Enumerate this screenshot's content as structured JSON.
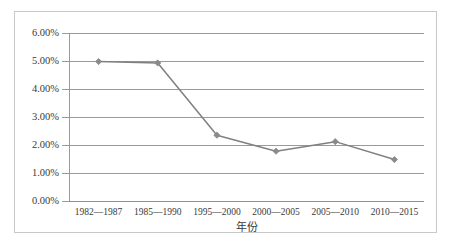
{
  "chart_data": {
    "type": "line",
    "title": "",
    "xlabel": "年份",
    "ylabel": "",
    "categories": [
      "1982—1987",
      "1985—1990",
      "1995—2000",
      "2000—2005",
      "2005—2010",
      "2010—2015"
    ],
    "values": [
      4.98,
      4.93,
      2.35,
      1.78,
      2.12,
      1.48
    ],
    "ylim": [
      0,
      6
    ],
    "ytick_step": 1,
    "ytick_labels": [
      "0.00%",
      "1.00%",
      "2.00%",
      "3.00%",
      "4.00%",
      "5.00%",
      "6.00%"
    ],
    "ytick_values": [
      0,
      1,
      2,
      3,
      4,
      5,
      6
    ],
    "value_suffix": "%",
    "grid": true,
    "legend": false,
    "legend_position": "none",
    "marker": "diamond",
    "series": [
      {
        "name": "",
        "values": [
          4.98,
          4.93,
          2.35,
          1.78,
          2.12,
          1.48
        ]
      }
    ]
  },
  "colors": {
    "series_line": "#808080",
    "marker": "#8a8a8a",
    "gridline": "#9a9a9a",
    "axis": "#9a9a9a",
    "frame": "#c9c9c9",
    "text": "#3a3a3a",
    "background": "#ffffff"
  }
}
